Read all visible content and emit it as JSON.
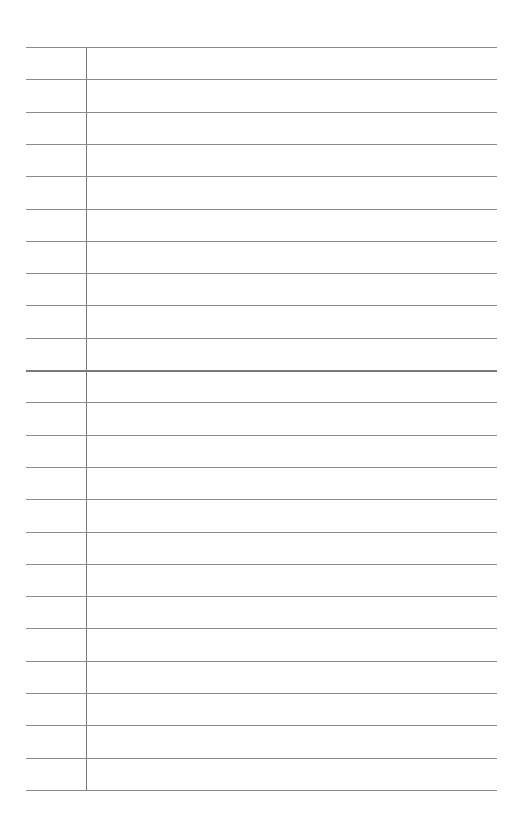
{
  "document": {
    "type": "lined-paper",
    "line_count": 24,
    "emphasized_line_index": 10,
    "has_margin_line": true,
    "text": ""
  }
}
